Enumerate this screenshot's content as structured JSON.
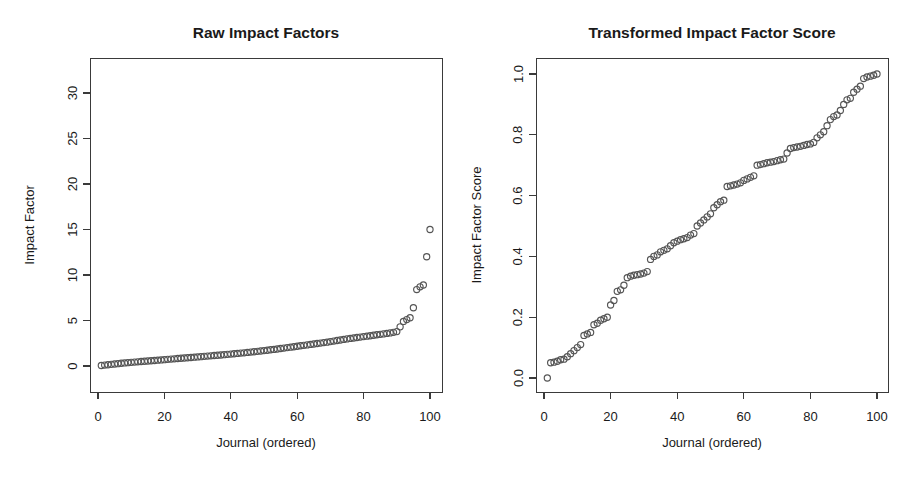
{
  "figure": {
    "background": "#ffffff",
    "point_color": "#555555",
    "axis_color": "#3a3a3a",
    "text_color": "#1a1a1a"
  },
  "chart_data": [
    {
      "type": "scatter",
      "panel": "left",
      "title": "Raw Impact Factors",
      "xlabel": "Journal (ordered)",
      "ylabel": "Impact Factor",
      "xlim": [
        -2.5,
        104
      ],
      "ylim": [
        -1.2,
        34.5
      ],
      "xticks": [
        0,
        20,
        40,
        60,
        80,
        100
      ],
      "xticklabels": [
        "0",
        "20",
        "40",
        "60",
        "80",
        "100"
      ],
      "yticks": [
        0,
        5,
        10,
        15,
        20,
        25,
        30
      ],
      "yticklabels": [
        "0",
        "5",
        "10",
        "15",
        "20",
        "25",
        "30"
      ],
      "grid": false,
      "legend": "none",
      "marker": "open-circle",
      "x": [
        1,
        2,
        3,
        4,
        5,
        6,
        7,
        8,
        9,
        10,
        11,
        12,
        13,
        14,
        15,
        16,
        17,
        18,
        19,
        20,
        21,
        22,
        23,
        24,
        25,
        26,
        27,
        28,
        29,
        30,
        31,
        32,
        33,
        34,
        35,
        36,
        37,
        38,
        39,
        40,
        41,
        42,
        43,
        44,
        45,
        46,
        47,
        48,
        49,
        50,
        51,
        52,
        53,
        54,
        55,
        56,
        57,
        58,
        59,
        60,
        61,
        62,
        63,
        64,
        65,
        66,
        67,
        68,
        69,
        70,
        71,
        72,
        73,
        74,
        75,
        76,
        77,
        78,
        79,
        80,
        81,
        82,
        83,
        84,
        85,
        86,
        87,
        88,
        89,
        90,
        91,
        92,
        93,
        94,
        95,
        96,
        97,
        98,
        99,
        100
      ],
      "y": [
        0.05,
        0.1,
        0.14,
        0.18,
        0.22,
        0.26,
        0.3,
        0.34,
        0.37,
        0.4,
        0.43,
        0.46,
        0.49,
        0.52,
        0.55,
        0.58,
        0.61,
        0.64,
        0.67,
        0.7,
        0.73,
        0.76,
        0.79,
        0.82,
        0.85,
        0.88,
        0.91,
        0.94,
        0.97,
        1.0,
        1.03,
        1.06,
        1.09,
        1.12,
        1.15,
        1.18,
        1.21,
        1.25,
        1.28,
        1.31,
        1.35,
        1.38,
        1.42,
        1.45,
        1.49,
        1.53,
        1.57,
        1.61,
        1.65,
        1.69,
        1.73,
        1.78,
        1.82,
        1.87,
        1.92,
        1.97,
        2.02,
        2.07,
        2.12,
        2.17,
        2.22,
        2.27,
        2.32,
        2.37,
        2.42,
        2.47,
        2.52,
        2.57,
        2.62,
        2.68,
        2.74,
        2.8,
        2.86,
        2.92,
        2.98,
        3.03,
        3.08,
        3.13,
        3.18,
        3.23,
        3.28,
        3.33,
        3.38,
        3.43,
        3.48,
        3.53,
        3.58,
        3.64,
        3.7,
        3.78,
        4.3,
        4.9,
        5.1,
        5.3,
        6.4,
        8.4,
        8.7,
        8.9,
        12.0,
        15.0,
        32.3
      ]
    },
    {
      "type": "scatter",
      "panel": "right",
      "title": "Transformed Impact Factor Score",
      "xlabel": "Journal (ordered)",
      "ylabel": "Impact Factor Score",
      "xlim": [
        -2.5,
        104
      ],
      "ylim": [
        -0.04,
        1.05
      ],
      "xticks": [
        0,
        20,
        40,
        60,
        80,
        100
      ],
      "xticklabels": [
        "0",
        "20",
        "40",
        "60",
        "80",
        "100"
      ],
      "yticks": [
        0.0,
        0.2,
        0.4,
        0.6,
        0.8,
        1.0
      ],
      "yticklabels": [
        "0.0",
        "0.2",
        "0.4",
        "0.6",
        "0.8",
        "1.0"
      ],
      "grid": false,
      "legend": "none",
      "marker": "open-circle",
      "x": [
        1,
        2,
        3,
        4,
        5,
        6,
        7,
        8,
        9,
        10,
        11,
        12,
        13,
        14,
        15,
        16,
        17,
        18,
        19,
        20,
        21,
        22,
        23,
        24,
        25,
        26,
        27,
        28,
        29,
        30,
        31,
        32,
        33,
        34,
        35,
        36,
        37,
        38,
        39,
        40,
        41,
        42,
        43,
        44,
        45,
        46,
        47,
        48,
        49,
        50,
        51,
        52,
        53,
        54,
        55,
        56,
        57,
        58,
        59,
        60,
        61,
        62,
        63,
        64,
        65,
        66,
        67,
        68,
        69,
        70,
        71,
        72,
        73,
        74,
        75,
        76,
        77,
        78,
        79,
        80,
        81,
        82,
        83,
        84,
        85,
        86,
        87,
        88,
        89,
        90,
        91,
        92,
        93,
        94,
        95,
        96,
        97,
        98,
        99,
        100
      ],
      "y": [
        0.0,
        0.05,
        0.052,
        0.055,
        0.06,
        0.062,
        0.07,
        0.08,
        0.09,
        0.1,
        0.11,
        0.14,
        0.145,
        0.15,
        0.175,
        0.18,
        0.19,
        0.195,
        0.2,
        0.24,
        0.255,
        0.285,
        0.29,
        0.305,
        0.33,
        0.335,
        0.338,
        0.34,
        0.342,
        0.345,
        0.35,
        0.39,
        0.4,
        0.405,
        0.415,
        0.42,
        0.425,
        0.435,
        0.445,
        0.45,
        0.455,
        0.458,
        0.462,
        0.47,
        0.475,
        0.5,
        0.51,
        0.52,
        0.53,
        0.54,
        0.56,
        0.57,
        0.58,
        0.585,
        0.63,
        0.632,
        0.635,
        0.638,
        0.642,
        0.65,
        0.655,
        0.66,
        0.665,
        0.7,
        0.702,
        0.705,
        0.708,
        0.71,
        0.712,
        0.715,
        0.718,
        0.72,
        0.74,
        0.755,
        0.758,
        0.76,
        0.762,
        0.765,
        0.768,
        0.77,
        0.775,
        0.79,
        0.8,
        0.81,
        0.83,
        0.85,
        0.86,
        0.865,
        0.88,
        0.9,
        0.915,
        0.92,
        0.94,
        0.95,
        0.96,
        0.985,
        0.99,
        0.993,
        0.996,
        1.0
      ]
    }
  ]
}
